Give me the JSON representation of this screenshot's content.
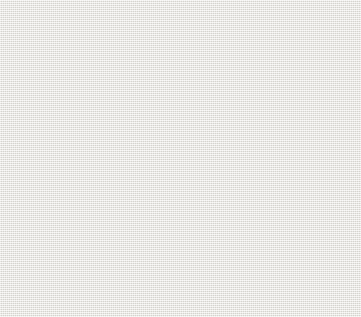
{
  "chart_data": {
    "type": "bar",
    "orientation": "horizontal",
    "title": "",
    "xlabel": "%",
    "ylabel": "",
    "xlim": [
      0,
      40
    ],
    "xticks": [
      0,
      5,
      10,
      15,
      20,
      25,
      30,
      35,
      40
    ],
    "grid": false,
    "legend_position": "middle-right",
    "categories": [
      "eat low fat versions\nof food",
      "Take more exercise",
      "Eat 5 portions of fruit\nand vegetables",
      "Drink more water",
      "Eat less sugar",
      "Cut down my salt intake",
      "Eat fast food",
      "Eat foods with more fibre",
      "Eat calorie-controlled foods",
      "I don't do anything because my\nlifestyle is healthy already",
      "I am not interested"
    ],
    "series": [
      {
        "name": "2012",
        "color": "#2c2c2e",
        "values": [
          40.0,
          37.7,
          36.2,
          33.2,
          29.5,
          20.1,
          18.6,
          17.2,
          12.4,
          11.6,
          11.0
        ]
      },
      {
        "name": "2006",
        "color": "#6f6f70",
        "values": [
          34.8,
          37.7,
          33.7,
          40.0,
          29.4,
          17.9,
          18.5,
          18.3,
          13.2,
          8.6,
          8.1
        ]
      }
    ]
  },
  "legend": {
    "items": [
      {
        "label": "2012",
        "color": "#2c2c2e"
      },
      {
        "label": "2006",
        "color": "#6f6f70"
      }
    ]
  },
  "colors": {
    "background": "#e9e8e3",
    "series_2012": "#2c2c2e",
    "series_2006": "#6f6f70",
    "axis": "#44443f",
    "text": "#17171a"
  }
}
